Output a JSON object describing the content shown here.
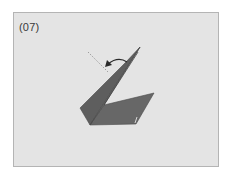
{
  "diagram": {
    "step_label": "(07)",
    "colors": {
      "background": "#e4e4e4",
      "border": "#b4b4b4",
      "paper_dark": "#5a5a5a",
      "paper_mid": "#676767",
      "paper_light": "#727272",
      "arrow": "#2a2a2a",
      "dashed_line": "#8a8a8a"
    },
    "elements": [
      {
        "type": "folded-paper-model",
        "description": "swan-like origami shape with tall pointed neck"
      },
      {
        "type": "fold-arrow",
        "description": "curved arrow indicating fold of the tip backward/left"
      },
      {
        "type": "dashed-fold-guide",
        "description": "dotted line showing destination of folded tip"
      }
    ]
  }
}
